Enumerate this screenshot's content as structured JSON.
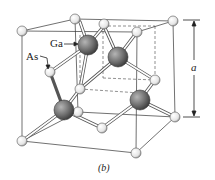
{
  "figure": {
    "caption": "(b)",
    "labels": {
      "ga": "Ga",
      "as": "As",
      "lattice_constant": "a"
    },
    "colors": {
      "ga_atom": "#6e6e6e",
      "as_atom": "#f2f2f2",
      "bond": "#ffffff",
      "line": "#333333"
    }
  }
}
